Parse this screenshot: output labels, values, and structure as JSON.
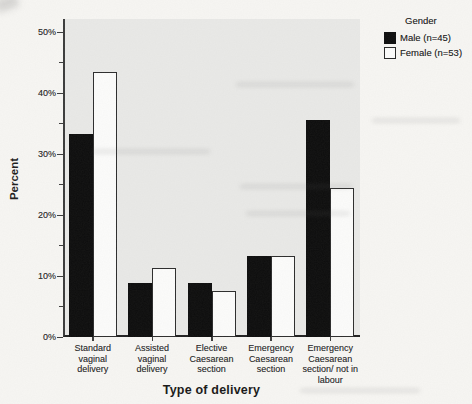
{
  "chart_data": {
    "type": "bar",
    "title": "",
    "xlabel": "Type of delivery",
    "ylabel": "Percent",
    "categories": [
      "Standard\nvaginal\ndelivery",
      "Assisted\nvaginal\ndelivery",
      "Elective\nCaesarean\nsection",
      "Emergency\nCaesarean\nsection",
      "Emergency\nCaesarean\nsection/ not in\nlabour"
    ],
    "series": [
      {
        "name": "Male (n=45)",
        "slug": "male",
        "color": "#0c0c0c",
        "outlined": false,
        "values": [
          33.3,
          8.9,
          8.9,
          13.3,
          35.6
        ]
      },
      {
        "name": "Female (n=53)",
        "slug": "female",
        "color": "#fcfcfb",
        "outlined": true,
        "values": [
          43.4,
          11.3,
          7.5,
          13.2,
          24.5
        ]
      }
    ],
    "ylim": [
      0,
      52
    ],
    "yticks": [
      0,
      10,
      20,
      30,
      40,
      50
    ],
    "ytick_labels": [
      "0%",
      "10%",
      "20%",
      "30%",
      "40%",
      "50%"
    ],
    "minor_tick_step": 5,
    "grid": false,
    "legend": {
      "title": "Gender",
      "position": "top-right"
    },
    "colors": {
      "plot_background": "#e9e9e7",
      "page_background": "#f7f6f3",
      "axis": "#2b2b2b",
      "bar_male": "#0c0c0c",
      "bar_female": "#fcfcfb",
      "bar_border": "#2b2b2b",
      "text": "#232323"
    }
  }
}
